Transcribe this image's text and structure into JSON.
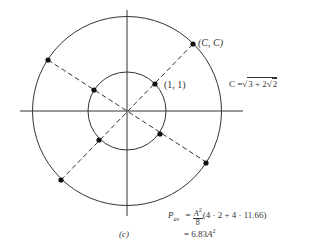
{
  "diagram": {
    "caption": "(c)",
    "center": {
      "x": 127,
      "y": 111
    },
    "outer_radius": 94,
    "inner_radius": 39,
    "outer_point_label": "(C, C)",
    "inner_point_label": "(1, 1)",
    "c_definition": {
      "lhs": "C =",
      "radical_outer": "3 + 2",
      "radical_inner": "2"
    },
    "formula": {
      "lhs_symbol": "P",
      "lhs_subscript": "av",
      "equals": "=",
      "frac_num": "A",
      "frac_num_exp": "2",
      "frac_den": "8",
      "expression": "(4 · 2 + 4 · 11.66)",
      "line2_equals": "= 6.83",
      "line2_var": "A",
      "line2_exp": "2"
    },
    "points_angles_deg": [
      45,
      135,
      225,
      315
    ],
    "colors": {
      "stroke": "#333333",
      "dot": "#111111"
    }
  }
}
